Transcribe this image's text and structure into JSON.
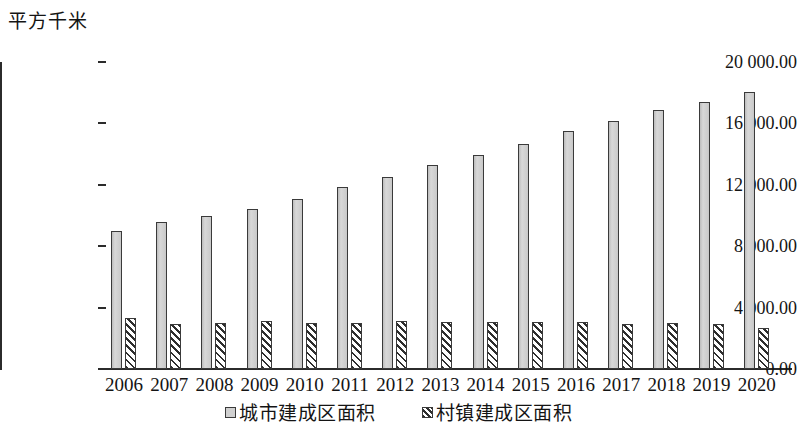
{
  "chart_data": {
    "type": "bar",
    "title": "",
    "subtitle": "",
    "xlabel": "",
    "ylabel": "平方千米",
    "unit_caption": "平方千米",
    "categories": [
      "2006",
      "2007",
      "2008",
      "2009",
      "2010",
      "2011",
      "2012",
      "2013",
      "2014",
      "2015",
      "2016",
      "2017",
      "2018",
      "2019",
      "2020"
    ],
    "ylim": [
      0,
      20000
    ],
    "y_ticks": [
      0,
      4000,
      8000,
      12000,
      16000,
      20000
    ],
    "y_tick_labels": [
      "0.00",
      "4 000.00",
      "8 000.00",
      "12 000.00",
      "16 000.00",
      "20 000.00"
    ],
    "grid": false,
    "legend_position": "bottom",
    "series": [
      {
        "name": "城市建成区面积",
        "style": "solid-gray",
        "color": "#cfcfcf",
        "values": [
          9000,
          9560,
          9950,
          10440,
          11080,
          11880,
          12530,
          13280,
          13960,
          14680,
          15480,
          16180,
          16850,
          17400,
          18070
        ]
      },
      {
        "name": "村镇建成区面积",
        "style": "diagonal-hatch",
        "color": "#2e2e2e",
        "values": [
          3330,
          2920,
          3000,
          3110,
          3030,
          2970,
          3120,
          3070,
          3060,
          3060,
          3060,
          2940,
          3030,
          2930,
          2680
        ]
      }
    ]
  },
  "legend": {
    "items": [
      {
        "label": "城市建成区面积",
        "swatch": "solid-gray-swatch"
      },
      {
        "label": "村镇建成区面积",
        "swatch": "hatched-swatch"
      }
    ]
  }
}
